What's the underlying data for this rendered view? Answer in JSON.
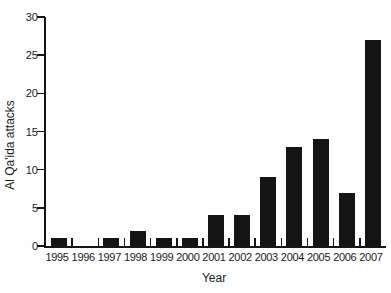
{
  "chart_data": {
    "type": "bar",
    "title": "",
    "xlabel": "Year",
    "ylabel": "Al Qa'ida attacks",
    "categories": [
      "1995",
      "1996",
      "1997",
      "1998",
      "1999",
      "2000",
      "2001",
      "2002",
      "2003",
      "2004",
      "2005",
      "2006",
      "2007"
    ],
    "values": [
      1,
      0,
      1,
      2,
      1,
      1,
      4,
      4,
      9,
      13,
      14,
      7,
      27
    ],
    "ylim": [
      0,
      30
    ],
    "yticks": [
      0,
      5,
      10,
      15,
      20,
      25,
      30
    ],
    "grid": false,
    "legend": "none",
    "bar_color": "#141414",
    "axis_color": "#161616",
    "background_color": "#fefefe"
  }
}
